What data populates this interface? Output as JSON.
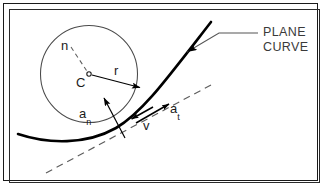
{
  "figure": {
    "type": "technical-diagram",
    "annotation_label": "PLANE\nCURVE",
    "annotation_line1": "PLANE",
    "annotation_line2": "CURVE",
    "labels": {
      "normal_direction": "n",
      "center": "C",
      "radius": "r",
      "normal_acceleration_base": "a",
      "normal_acceleration_sub": "n",
      "velocity": "v",
      "tangential_acceleration_base": "a",
      "tangential_acceleration_sub": "t"
    },
    "colors": {
      "ink": "#1b1b1b",
      "frame_outer": "#1a1a1a",
      "frame_inner": "#2b2b2b",
      "circle_stroke": "#4a4a4a",
      "curve_stroke": "#000000",
      "dashed_stroke": "#6a6a6a",
      "leader_stroke": "#555555",
      "text": "#1b1b1b",
      "annotation_text": "#3a3a3a",
      "background": "#ffffff"
    },
    "geometry": {
      "osculating_circle": {
        "cx": 89,
        "cy": 74,
        "r": 48.5
      },
      "center_point": {
        "x": 89,
        "y": 74
      },
      "radius_arrow": {
        "x1": 91,
        "y1": 75,
        "x2": 141,
        "y2": 88
      },
      "normal_leader_dashed": {
        "x1": 71,
        "y1": 47,
        "x2": 87,
        "y2": 71
      },
      "normal_accel_arrow": {
        "x1": 124,
        "y1": 137,
        "x2": 104,
        "y2": 98
      },
      "tangent_dashed_line": {
        "x1": 46,
        "y1": 173,
        "x2": 211,
        "y2": 85
      },
      "velocity_arrow": {
        "x1": 152,
        "y1": 107,
        "x2": 133,
        "y2": 118
      },
      "tangential_accel_arrow": {
        "x1": 137,
        "y1": 122,
        "x2": 168,
        "y2": 104
      },
      "leader_to_curve": {
        "ax": 185,
        "ay": 53,
        "bx": 219,
        "by": 33,
        "cx": 258,
        "cy": 33
      },
      "plane_curve_path": "M18,134 C48,144 86,145 116,128 C142,113 166,80 211,22"
    }
  }
}
